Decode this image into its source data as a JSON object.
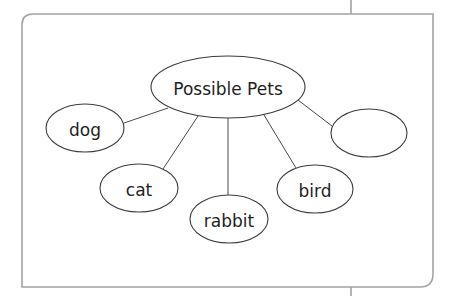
{
  "diagram": {
    "type": "concept-web",
    "colors": {
      "frame": "#a3a3a3",
      "stroke": "#3c3c3c",
      "text": "#1e1e1e",
      "background": "#ffffff"
    },
    "center": {
      "label": "Possible Pets"
    },
    "nodes": [
      {
        "id": "dog",
        "label": "dog"
      },
      {
        "id": "cat",
        "label": "cat"
      },
      {
        "id": "rabbit",
        "label": "rabbit"
      },
      {
        "id": "bird",
        "label": "bird"
      },
      {
        "id": "blank",
        "label": ""
      }
    ]
  }
}
